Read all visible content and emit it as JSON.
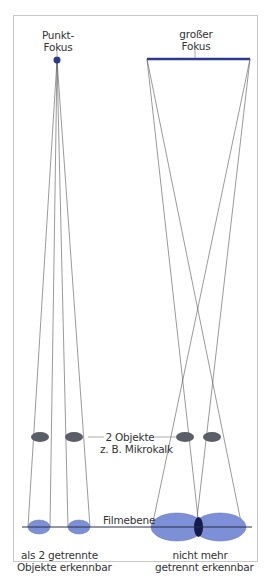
{
  "diagram": {
    "left_panel": {
      "focus_label_line1": "Punkt-",
      "focus_label_line2": "Fokus",
      "result_line1": "als 2 getrennte",
      "result_line2": "Objekte erkennbar"
    },
    "right_panel": {
      "focus_label_line1": "großer",
      "focus_label_line2": "Fokus",
      "result_line1": "nicht mehr",
      "result_line2": "getrennt erkennbar"
    },
    "objects_label_line1": "2 Objekte",
    "objects_label_line2": "z. B. Mikrokalk",
    "film_plane_label": "Filmebene",
    "colors": {
      "focus": "#2b3a8f",
      "object": "#5a5e66",
      "image": "#7d8fd6",
      "overlap": "#141a4a",
      "ray": "#444444"
    }
  }
}
